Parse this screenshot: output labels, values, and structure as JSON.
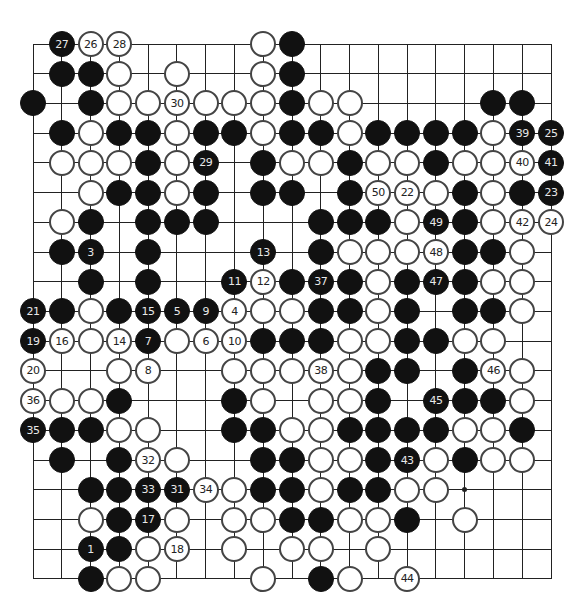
{
  "board": {
    "size": 19,
    "origin_x": 33,
    "origin_y": 44,
    "spacing_x": 28.78,
    "spacing_y": 29.72,
    "colors": {
      "black": "#111111",
      "white": "#ffffff",
      "line": "#222222"
    },
    "hoshi": [
      [
        16,
        16
      ]
    ],
    "stones": [
      [
        2,
        1,
        "b",
        "27"
      ],
      [
        3,
        1,
        "w",
        "26"
      ],
      [
        4,
        1,
        "w",
        "28"
      ],
      [
        9,
        1,
        "w",
        ""
      ],
      [
        10,
        1,
        "b",
        ""
      ],
      [
        2,
        2,
        "b",
        ""
      ],
      [
        3,
        2,
        "b",
        ""
      ],
      [
        4,
        2,
        "w",
        ""
      ],
      [
        6,
        2,
        "w",
        ""
      ],
      [
        9,
        2,
        "w",
        ""
      ],
      [
        10,
        2,
        "b",
        ""
      ],
      [
        1,
        3,
        "b",
        ""
      ],
      [
        3,
        3,
        "b",
        ""
      ],
      [
        4,
        3,
        "w",
        ""
      ],
      [
        5,
        3,
        "w",
        ""
      ],
      [
        6,
        3,
        "w",
        "30"
      ],
      [
        7,
        3,
        "w",
        ""
      ],
      [
        8,
        3,
        "w",
        ""
      ],
      [
        9,
        3,
        "w",
        ""
      ],
      [
        10,
        3,
        "b",
        ""
      ],
      [
        11,
        3,
        "w",
        ""
      ],
      [
        12,
        3,
        "w",
        ""
      ],
      [
        17,
        3,
        "b",
        ""
      ],
      [
        18,
        3,
        "b",
        ""
      ],
      [
        2,
        4,
        "b",
        ""
      ],
      [
        3,
        4,
        "w",
        ""
      ],
      [
        4,
        4,
        "b",
        ""
      ],
      [
        5,
        4,
        "b",
        ""
      ],
      [
        6,
        4,
        "w",
        ""
      ],
      [
        7,
        4,
        "b",
        ""
      ],
      [
        8,
        4,
        "b",
        ""
      ],
      [
        9,
        4,
        "w",
        ""
      ],
      [
        10,
        4,
        "b",
        ""
      ],
      [
        11,
        4,
        "b",
        ""
      ],
      [
        12,
        4,
        "w",
        ""
      ],
      [
        13,
        4,
        "b",
        ""
      ],
      [
        14,
        4,
        "b",
        ""
      ],
      [
        15,
        4,
        "b",
        ""
      ],
      [
        16,
        4,
        "b",
        ""
      ],
      [
        17,
        4,
        "w",
        ""
      ],
      [
        18,
        4,
        "b",
        "39"
      ],
      [
        19,
        4,
        "b",
        "25"
      ],
      [
        2,
        5,
        "w",
        ""
      ],
      [
        3,
        5,
        "w",
        ""
      ],
      [
        4,
        5,
        "w",
        ""
      ],
      [
        5,
        5,
        "b",
        ""
      ],
      [
        6,
        5,
        "w",
        ""
      ],
      [
        7,
        5,
        "b",
        "29"
      ],
      [
        9,
        5,
        "b",
        ""
      ],
      [
        10,
        5,
        "w",
        ""
      ],
      [
        11,
        5,
        "w",
        ""
      ],
      [
        12,
        5,
        "b",
        ""
      ],
      [
        13,
        5,
        "w",
        ""
      ],
      [
        14,
        5,
        "w",
        ""
      ],
      [
        15,
        5,
        "b",
        ""
      ],
      [
        16,
        5,
        "w",
        ""
      ],
      [
        17,
        5,
        "w",
        ""
      ],
      [
        18,
        5,
        "w",
        "40"
      ],
      [
        19,
        5,
        "b",
        "41"
      ],
      [
        3,
        6,
        "w",
        ""
      ],
      [
        4,
        6,
        "b",
        ""
      ],
      [
        5,
        6,
        "b",
        ""
      ],
      [
        6,
        6,
        "w",
        ""
      ],
      [
        7,
        6,
        "b",
        ""
      ],
      [
        9,
        6,
        "b",
        ""
      ],
      [
        10,
        6,
        "b",
        ""
      ],
      [
        12,
        6,
        "b",
        ""
      ],
      [
        13,
        6,
        "w",
        "50"
      ],
      [
        14,
        6,
        "w",
        "22"
      ],
      [
        15,
        6,
        "w",
        ""
      ],
      [
        16,
        6,
        "b",
        ""
      ],
      [
        17,
        6,
        "w",
        ""
      ],
      [
        18,
        6,
        "b",
        ""
      ],
      [
        19,
        6,
        "b",
        "23"
      ],
      [
        2,
        7,
        "w",
        ""
      ],
      [
        3,
        7,
        "b",
        ""
      ],
      [
        5,
        7,
        "b",
        ""
      ],
      [
        6,
        7,
        "b",
        ""
      ],
      [
        7,
        7,
        "b",
        ""
      ],
      [
        11,
        7,
        "b",
        ""
      ],
      [
        12,
        7,
        "b",
        ""
      ],
      [
        13,
        7,
        "b",
        ""
      ],
      [
        14,
        7,
        "w",
        ""
      ],
      [
        15,
        7,
        "b",
        "49"
      ],
      [
        16,
        7,
        "b",
        ""
      ],
      [
        17,
        7,
        "w",
        ""
      ],
      [
        18,
        7,
        "w",
        "42"
      ],
      [
        19,
        7,
        "w",
        "24"
      ],
      [
        2,
        8,
        "b",
        ""
      ],
      [
        3,
        8,
        "b",
        "3"
      ],
      [
        5,
        8,
        "b",
        ""
      ],
      [
        9,
        8,
        "b",
        "13"
      ],
      [
        11,
        8,
        "b",
        ""
      ],
      [
        12,
        8,
        "w",
        ""
      ],
      [
        13,
        8,
        "w",
        ""
      ],
      [
        14,
        8,
        "w",
        ""
      ],
      [
        15,
        8,
        "w",
        "48"
      ],
      [
        16,
        8,
        "b",
        ""
      ],
      [
        17,
        8,
        "b",
        ""
      ],
      [
        18,
        8,
        "w",
        ""
      ],
      [
        3,
        9,
        "b",
        ""
      ],
      [
        5,
        9,
        "b",
        ""
      ],
      [
        8,
        9,
        "b",
        "11"
      ],
      [
        9,
        9,
        "w",
        "12"
      ],
      [
        10,
        9,
        "b",
        ""
      ],
      [
        11,
        9,
        "b",
        "37"
      ],
      [
        12,
        9,
        "b",
        ""
      ],
      [
        13,
        9,
        "w",
        ""
      ],
      [
        14,
        9,
        "b",
        ""
      ],
      [
        15,
        9,
        "b",
        "47"
      ],
      [
        16,
        9,
        "b",
        ""
      ],
      [
        17,
        9,
        "w",
        ""
      ],
      [
        18,
        9,
        "w",
        ""
      ],
      [
        1,
        10,
        "b",
        "21"
      ],
      [
        2,
        10,
        "b",
        ""
      ],
      [
        3,
        10,
        "w",
        ""
      ],
      [
        4,
        10,
        "b",
        ""
      ],
      [
        5,
        10,
        "b",
        "15"
      ],
      [
        6,
        10,
        "b",
        "5"
      ],
      [
        7,
        10,
        "b",
        "9"
      ],
      [
        8,
        10,
        "w",
        "4"
      ],
      [
        9,
        10,
        "w",
        ""
      ],
      [
        10,
        10,
        "w",
        ""
      ],
      [
        11,
        10,
        "b",
        ""
      ],
      [
        12,
        10,
        "b",
        ""
      ],
      [
        13,
        10,
        "w",
        ""
      ],
      [
        14,
        10,
        "b",
        ""
      ],
      [
        16,
        10,
        "b",
        ""
      ],
      [
        17,
        10,
        "b",
        ""
      ],
      [
        18,
        10,
        "w",
        ""
      ],
      [
        1,
        11,
        "b",
        "19"
      ],
      [
        2,
        11,
        "w",
        "16"
      ],
      [
        3,
        11,
        "w",
        ""
      ],
      [
        4,
        11,
        "w",
        "14"
      ],
      [
        5,
        11,
        "b",
        "7"
      ],
      [
        6,
        11,
        "w",
        ""
      ],
      [
        7,
        11,
        "w",
        "6"
      ],
      [
        8,
        11,
        "w",
        "10"
      ],
      [
        9,
        11,
        "b",
        ""
      ],
      [
        10,
        11,
        "b",
        ""
      ],
      [
        11,
        11,
        "b",
        ""
      ],
      [
        12,
        11,
        "w",
        ""
      ],
      [
        13,
        11,
        "w",
        ""
      ],
      [
        14,
        11,
        "b",
        ""
      ],
      [
        15,
        11,
        "b",
        ""
      ],
      [
        16,
        11,
        "w",
        ""
      ],
      [
        17,
        11,
        "w",
        ""
      ],
      [
        1,
        12,
        "w",
        "20"
      ],
      [
        4,
        12,
        "w",
        ""
      ],
      [
        5,
        12,
        "w",
        "8"
      ],
      [
        8,
        12,
        "w",
        ""
      ],
      [
        9,
        12,
        "w",
        ""
      ],
      [
        10,
        12,
        "w",
        ""
      ],
      [
        11,
        12,
        "w",
        "38"
      ],
      [
        12,
        12,
        "w",
        ""
      ],
      [
        13,
        12,
        "b",
        ""
      ],
      [
        14,
        12,
        "b",
        ""
      ],
      [
        16,
        12,
        "b",
        ""
      ],
      [
        17,
        12,
        "w",
        "46"
      ],
      [
        18,
        12,
        "w",
        ""
      ],
      [
        1,
        13,
        "w",
        "36"
      ],
      [
        2,
        13,
        "w",
        ""
      ],
      [
        3,
        13,
        "w",
        ""
      ],
      [
        4,
        13,
        "b",
        ""
      ],
      [
        8,
        13,
        "b",
        ""
      ],
      [
        9,
        13,
        "w",
        ""
      ],
      [
        11,
        13,
        "w",
        ""
      ],
      [
        12,
        13,
        "w",
        ""
      ],
      [
        13,
        13,
        "b",
        ""
      ],
      [
        15,
        13,
        "b",
        "45"
      ],
      [
        16,
        13,
        "b",
        ""
      ],
      [
        17,
        13,
        "b",
        ""
      ],
      [
        18,
        13,
        "w",
        ""
      ],
      [
        1,
        14,
        "b",
        "35"
      ],
      [
        2,
        14,
        "b",
        ""
      ],
      [
        3,
        14,
        "b",
        ""
      ],
      [
        4,
        14,
        "w",
        ""
      ],
      [
        5,
        14,
        "w",
        ""
      ],
      [
        8,
        14,
        "b",
        ""
      ],
      [
        9,
        14,
        "b",
        ""
      ],
      [
        10,
        14,
        "w",
        ""
      ],
      [
        11,
        14,
        "w",
        ""
      ],
      [
        12,
        14,
        "b",
        ""
      ],
      [
        13,
        14,
        "b",
        ""
      ],
      [
        14,
        14,
        "b",
        ""
      ],
      [
        15,
        14,
        "b",
        ""
      ],
      [
        16,
        14,
        "w",
        ""
      ],
      [
        17,
        14,
        "w",
        ""
      ],
      [
        18,
        14,
        "b",
        ""
      ],
      [
        2,
        15,
        "b",
        ""
      ],
      [
        4,
        15,
        "b",
        ""
      ],
      [
        5,
        15,
        "w",
        "32"
      ],
      [
        6,
        15,
        "w",
        ""
      ],
      [
        9,
        15,
        "b",
        ""
      ],
      [
        10,
        15,
        "b",
        ""
      ],
      [
        11,
        15,
        "w",
        ""
      ],
      [
        12,
        15,
        "w",
        ""
      ],
      [
        13,
        15,
        "b",
        ""
      ],
      [
        14,
        15,
        "b",
        "43"
      ],
      [
        15,
        15,
        "w",
        ""
      ],
      [
        16,
        15,
        "b",
        ""
      ],
      [
        17,
        15,
        "w",
        ""
      ],
      [
        18,
        15,
        "w",
        ""
      ],
      [
        3,
        16,
        "b",
        ""
      ],
      [
        4,
        16,
        "b",
        ""
      ],
      [
        5,
        16,
        "b",
        "33"
      ],
      [
        6,
        16,
        "b",
        "31"
      ],
      [
        7,
        16,
        "w",
        "34"
      ],
      [
        8,
        16,
        "w",
        ""
      ],
      [
        9,
        16,
        "b",
        ""
      ],
      [
        10,
        16,
        "b",
        ""
      ],
      [
        11,
        16,
        "w",
        ""
      ],
      [
        12,
        16,
        "b",
        ""
      ],
      [
        13,
        16,
        "b",
        ""
      ],
      [
        14,
        16,
        "w",
        ""
      ],
      [
        15,
        16,
        "w",
        ""
      ],
      [
        3,
        17,
        "w",
        ""
      ],
      [
        4,
        17,
        "b",
        ""
      ],
      [
        5,
        17,
        "b",
        "17"
      ],
      [
        6,
        17,
        "w",
        ""
      ],
      [
        8,
        17,
        "w",
        ""
      ],
      [
        9,
        17,
        "w",
        ""
      ],
      [
        10,
        17,
        "b",
        ""
      ],
      [
        11,
        17,
        "b",
        ""
      ],
      [
        12,
        17,
        "w",
        ""
      ],
      [
        13,
        17,
        "w",
        ""
      ],
      [
        14,
        17,
        "b",
        ""
      ],
      [
        16,
        17,
        "w",
        ""
      ],
      [
        3,
        18,
        "b",
        "1"
      ],
      [
        4,
        18,
        "b",
        ""
      ],
      [
        5,
        18,
        "w",
        ""
      ],
      [
        6,
        18,
        "w",
        "18"
      ],
      [
        8,
        18,
        "w",
        ""
      ],
      [
        10,
        18,
        "w",
        ""
      ],
      [
        11,
        18,
        "w",
        ""
      ],
      [
        13,
        18,
        "w",
        ""
      ],
      [
        3,
        19,
        "b",
        ""
      ],
      [
        4,
        19,
        "w",
        ""
      ],
      [
        5,
        19,
        "w",
        ""
      ],
      [
        9,
        19,
        "w",
        ""
      ],
      [
        11,
        19,
        "b",
        ""
      ],
      [
        12,
        19,
        "w",
        ""
      ],
      [
        14,
        19,
        "w",
        "44"
      ]
    ]
  }
}
